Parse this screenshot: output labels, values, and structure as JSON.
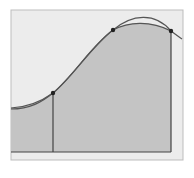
{
  "diagram": {
    "type": "numerical-integration-parabolic-approximation",
    "colors": {
      "background": "#ffffff",
      "frame_fill": "#ececec",
      "frame_stroke": "#bdbdbd",
      "area_fill": "#c4c4c4",
      "lens_fill": "#b3b3b3",
      "curve_stroke": "#555555",
      "axis_stroke": "#444444",
      "point_fill": "#222222"
    },
    "frame": {
      "x": 11,
      "y": 10,
      "width": 172,
      "height": 150
    },
    "baseline": {
      "x1": 11,
      "y1": 152,
      "x2": 171,
      "y2": 152
    },
    "verticals": [
      {
        "x": 53,
        "y_top": 93,
        "y_bottom": 152
      },
      {
        "x": 171,
        "y_top": 31,
        "y_bottom": 152
      }
    ],
    "points": [
      {
        "label": "",
        "x": 53,
        "y": 93
      },
      {
        "label": "",
        "x": 113,
        "y": 30
      },
      {
        "label": "",
        "x": 171,
        "y": 31
      }
    ],
    "curves": {
      "function_path": "M11,108 C30,107 42,101 53,93 C72,78 90,48 113,30 C128,22 150,20 171,31",
      "parabola_path": "M11,109 C30,109 42,102 53,93 C75,74 92,45 113,30 C132,14 155,12 171,31 C175,34 179,37 182,39",
      "area_path": "M11,152 L11,108 C30,107 42,101 53,93 C72,78 90,48 113,30 C128,22 150,20 171,31 L171,152 Z"
    }
  }
}
